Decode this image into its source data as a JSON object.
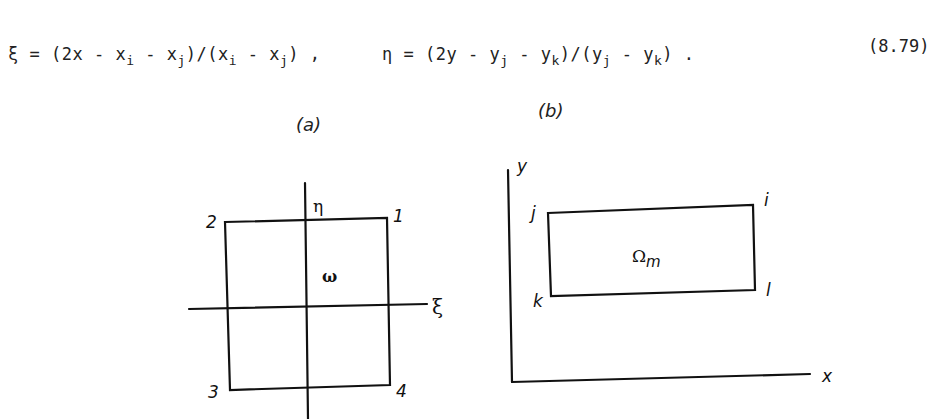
{
  "equation": {
    "xi_lhs": "ξ",
    "xi_rhs_parts": [
      "= (2x - x",
      "i",
      " - x",
      "j",
      ")/(x",
      "i",
      " - x",
      "j",
      ") ,"
    ],
    "eta_lhs": "η",
    "eta_rhs_parts": [
      "= (2y - y",
      "j",
      " - y",
      "k",
      ")/(y",
      "j",
      " - y",
      "k",
      ") ."
    ],
    "number": "(8.79)"
  },
  "figure_a": {
    "label": "(a)",
    "axis_h_label": "ξ",
    "axis_v_label": "η",
    "region_label": "ω",
    "nodes": [
      "1",
      "2",
      "3",
      "4"
    ]
  },
  "figure_b": {
    "label": "(b)",
    "x_axis_label": "x",
    "y_axis_label": "y",
    "region_label": "Ω",
    "region_subscript": "m",
    "nodes": [
      "i",
      "j",
      "k",
      "l"
    ]
  }
}
